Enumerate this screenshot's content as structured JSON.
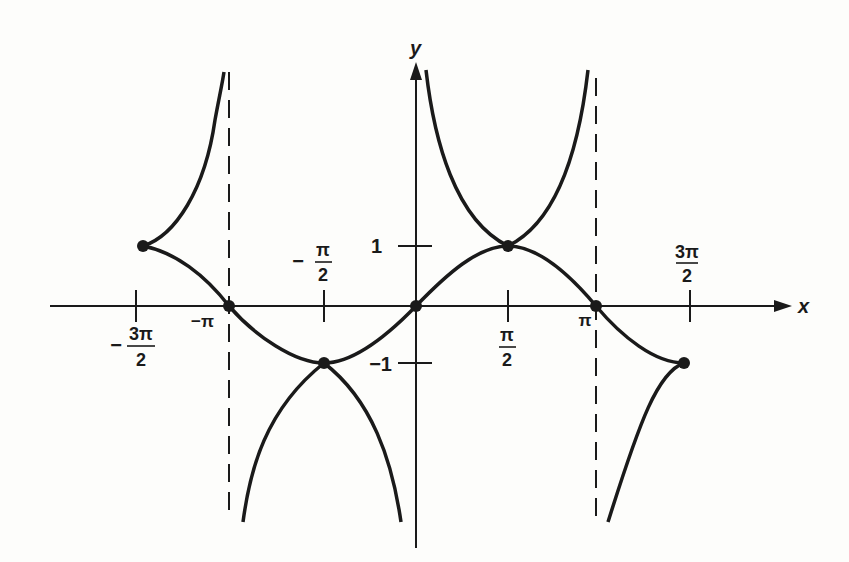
{
  "figure": {
    "axes": {
      "x_label": "x",
      "y_label": "y"
    },
    "x_ticks": [
      {
        "value": "-3π/2",
        "numerator": "3π",
        "denominator": "2",
        "sign": "−",
        "position": "below"
      },
      {
        "value": "-π",
        "text": "−π",
        "position": "below"
      },
      {
        "value": "-π/2",
        "numerator": "π",
        "denominator": "2",
        "sign": "−",
        "position": "above"
      },
      {
        "value": "π/2",
        "numerator": "π",
        "denominator": "2",
        "sign": "",
        "position": "below"
      },
      {
        "value": "π",
        "text": "π",
        "position": "below"
      },
      {
        "value": "3π/2",
        "numerator": "3π",
        "denominator": "2",
        "sign": "",
        "position": "above"
      }
    ],
    "y_ticks": [
      {
        "value": 1,
        "text": "1"
      },
      {
        "value": -1,
        "text": "−1"
      }
    ],
    "curves": [
      {
        "name": "sin x",
        "domain": "[-3π/2, 3π/2]",
        "style": "solid"
      },
      {
        "name": "csc x",
        "branches": [
          "(-3π/2, -π)",
          "(-π, 0)",
          "(0, π)",
          "(π, 3π/2)"
        ],
        "style": "solid"
      }
    ],
    "asymptotes": [
      {
        "x": "-π",
        "style": "dashed"
      },
      {
        "x": "π",
        "style": "dashed"
      }
    ],
    "marked_points": [
      {
        "x": "-3π/2",
        "y": 1
      },
      {
        "x": "-π",
        "y": 0
      },
      {
        "x": "-π/2",
        "y": -1
      },
      {
        "x": "0",
        "y": 0
      },
      {
        "x": "π/2",
        "y": 1
      },
      {
        "x": "π",
        "y": 0
      },
      {
        "x": "3π/2",
        "y": -1
      }
    ],
    "colors": {
      "ink": "#1a1a1a",
      "background": "#fdfdfb"
    }
  }
}
